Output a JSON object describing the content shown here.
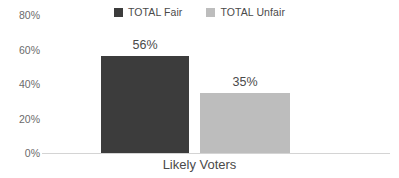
{
  "chart_data": {
    "type": "bar",
    "title": "",
    "xlabel": "",
    "ylabel": "",
    "categories": [
      "Likely Voters"
    ],
    "series": [
      {
        "name": "TOTAL Fair",
        "values": [
          56
        ],
        "color": "#3c3c3c",
        "labels": [
          "56%"
        ]
      },
      {
        "name": "TOTAL Unfair",
        "values": [
          35
        ],
        "color": "#bdbdbd",
        "labels": [
          "35%"
        ]
      }
    ],
    "ylim": [
      0,
      80
    ],
    "yticks": [
      0,
      20,
      40,
      60,
      80
    ],
    "ytick_labels": [
      "0%",
      "20%",
      "40%",
      "60%",
      "80%"
    ],
    "grid": false,
    "legend_position": "top-center",
    "value_suffix": "%"
  },
  "legend": {
    "items": [
      {
        "label": "TOTAL Fair",
        "color": "#3c3c3c"
      },
      {
        "label": "TOTAL Unfair",
        "color": "#bdbdbd"
      }
    ]
  },
  "axis": {
    "y_labels": [
      "80%",
      "60%",
      "40%",
      "20%",
      "0%"
    ],
    "category_label": "Likely Voters"
  },
  "bars": [
    {
      "name": "total-fair",
      "label": "56%",
      "value": 56,
      "color": "#3c3c3c",
      "left": 101,
      "width": 88
    },
    {
      "name": "total-unfair",
      "label": "35%",
      "value": 35,
      "color": "#bdbdbd",
      "left": 200,
      "width": 90
    }
  ],
  "colors": {
    "fair": "#3c3c3c",
    "unfair": "#bdbdbd",
    "axis_line": "#d4d4d4",
    "text": "#4a4a4a",
    "tick_text": "#6b6b6b",
    "background": "#ffffff"
  }
}
